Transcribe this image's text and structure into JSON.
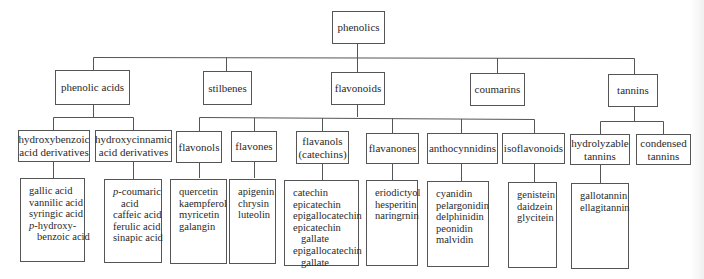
{
  "root": {
    "label": "phenolics"
  },
  "level1": [
    {
      "label": "phenolic acids"
    },
    {
      "label": "stilbenes"
    },
    {
      "label": "flavonoids"
    },
    {
      "label": "coumarins"
    },
    {
      "label": "tannins"
    }
  ],
  "level2": {
    "hydroxybenzoic": {
      "label": "hydroxybenzoic\nacid derivatives"
    },
    "hydroxycinnamic": {
      "label": "hydroxycinnamic\nacid derivatives"
    },
    "flavonols": {
      "label": "flavonols"
    },
    "flavones": {
      "label": "flavones"
    },
    "flavanols": {
      "label": "flavanols\n(catechins)"
    },
    "flavanones": {
      "label": "flavanones"
    },
    "anthocynnidins": {
      "label": "anthocynnidins"
    },
    "isoflavonoids": {
      "label": "isoflavonoids"
    },
    "hydrolyzable": {
      "label": "hydrolyzable\ntannins"
    },
    "condensed": {
      "label": "condensed\ntannins"
    }
  },
  "leaves": {
    "hydroxybenzoic": [
      "gallic acid",
      "vannilic acid",
      "syringic acid",
      "p-hydroxy-",
      "benzoic acid"
    ],
    "hydroxycinnamic": [
      "p-coumaric",
      "acid",
      "caffeic acid",
      "ferulic acid",
      "sinapic acid"
    ],
    "flavonols": [
      "quercetin",
      "kaempferol",
      "myricetin",
      "galangin"
    ],
    "flavones": [
      "apigenin",
      "chrysin",
      "luteolin"
    ],
    "flavanols": [
      "catechin",
      "epicatechin",
      "epigallocatechin",
      "epicatechin",
      "gallate",
      "epigallocatechin",
      "gallate"
    ],
    "flavanones": [
      "eriodictyol",
      "hesperitin",
      "naringrnin"
    ],
    "anthocynnidins": [
      "cyanidin",
      "pelargonidin",
      "delphinidin",
      "peonidin",
      "malvidin"
    ],
    "isoflavonoids": [
      "genistein",
      "daidzein",
      "glycitein"
    ],
    "hydrolyzable": [
      "gallotannin",
      "ellagitannin"
    ]
  }
}
